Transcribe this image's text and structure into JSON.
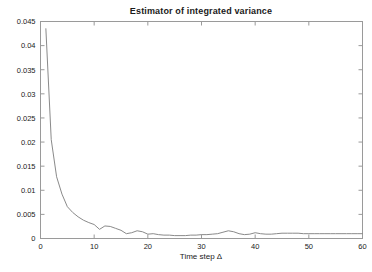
{
  "chart_data": {
    "type": "line",
    "title": "Estimator of integrated variance",
    "xlabel": "Time step Δ",
    "ylabel": "",
    "xlim": [
      0,
      60
    ],
    "ylim": [
      0,
      0.045
    ],
    "grid": false,
    "legend": null,
    "line_color": "#8a8a8a",
    "background_color": "#ffffff",
    "axis_color": "#9a9a9a",
    "xticks": [
      0,
      10,
      20,
      30,
      40,
      50,
      60
    ],
    "xtick_labels": [
      "0",
      "10",
      "20",
      "30",
      "40",
      "50",
      "60"
    ],
    "yticks": [
      0,
      0.005,
      0.01,
      0.015,
      0.02,
      0.025,
      0.03,
      0.035,
      0.04,
      0.045
    ],
    "ytick_labels": [
      "0",
      "0.005",
      "0.01",
      "0.015",
      "0.02",
      "0.025",
      "0.03",
      "0.035",
      "0.04",
      "0.045"
    ],
    "series": [
      {
        "name": "Estimator of integrated variance",
        "x": [
          1,
          2,
          3,
          4,
          5,
          6,
          7,
          8,
          9,
          10,
          11,
          12,
          13,
          14,
          15,
          16,
          17,
          18,
          19,
          20,
          21,
          22,
          23,
          24,
          25,
          26,
          27,
          28,
          29,
          30,
          31,
          32,
          33,
          34,
          35,
          36,
          37,
          38,
          39,
          40,
          41,
          42,
          43,
          44,
          45,
          46,
          47,
          48,
          49,
          50,
          51,
          52,
          53,
          54,
          55,
          56,
          57,
          58,
          59,
          60
        ],
        "y": [
          0.0435,
          0.0205,
          0.0128,
          0.0092,
          0.0066,
          0.0054,
          0.0045,
          0.0038,
          0.0033,
          0.0029,
          0.0019,
          0.0026,
          0.0025,
          0.0021,
          0.0017,
          0.001,
          0.0012,
          0.0016,
          0.0014,
          0.0009,
          0.001,
          0.0008,
          0.0007,
          0.0007,
          0.0006,
          0.0006,
          0.0006,
          0.0007,
          0.0007,
          0.0008,
          0.0008,
          0.0009,
          0.001,
          0.0013,
          0.0016,
          0.0014,
          0.001,
          0.0008,
          0.0009,
          0.0012,
          0.001,
          0.0009,
          0.0009,
          0.001,
          0.0011,
          0.0011,
          0.0011,
          0.0011,
          0.001,
          0.001,
          0.001,
          0.001,
          0.001,
          0.001,
          0.001,
          0.001,
          0.001,
          0.001,
          0.001,
          0.001
        ]
      }
    ]
  }
}
